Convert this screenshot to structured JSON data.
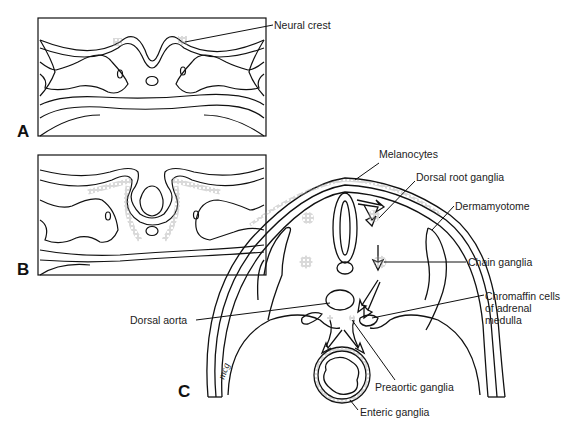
{
  "figure": {
    "panels": [
      {
        "id": "A",
        "label": "A"
      },
      {
        "id": "B",
        "label": "B"
      },
      {
        "id": "C",
        "label": "C"
      }
    ],
    "labels": {
      "neural_crest": "Neural crest",
      "melanocytes": "Melanocytes",
      "dorsal_root_ganglia": "Dorsal root ganglia",
      "dermamyotome": "Dermamyotome",
      "chain_ganglia": "Chain ganglia",
      "chromaffin_line1": "Chromaffin cells",
      "chromaffin_line2": "of adrenal",
      "chromaffin_line3": "medulla",
      "dorsal_aorta": "Dorsal aorta",
      "preaortic_ganglia": "Preaortic ganglia",
      "enteric_ganglia": "Enteric ganglia"
    },
    "signature": "mcg",
    "colors": {
      "line": "#111111",
      "cells": "#9a9a9a",
      "background": "#ffffff"
    }
  }
}
